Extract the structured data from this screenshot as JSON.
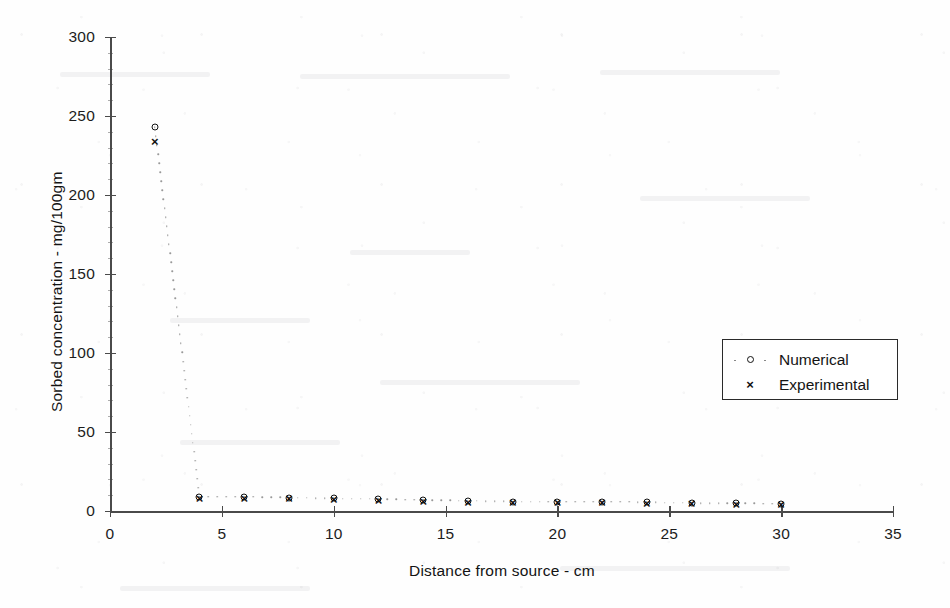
{
  "chart_data": {
    "type": "scatter",
    "title": "",
    "xlabel": "Distance from source  -  cm",
    "ylabel": "Sorbed concentration  -  mg/100gm",
    "xlim": [
      0,
      35
    ],
    "ylim": [
      0,
      300
    ],
    "xticks": [
      0,
      5,
      10,
      15,
      20,
      25,
      30,
      35
    ],
    "yticks": [
      0,
      50,
      100,
      150,
      200,
      250,
      300
    ],
    "xtick_labels": [
      "0",
      "5",
      "10",
      "15",
      "20",
      "25",
      "30",
      "35"
    ],
    "ytick_labels": [
      "0",
      "50",
      "100",
      "150",
      "200",
      "250",
      "300"
    ],
    "grid": false,
    "legend_position": "center-right",
    "x": [
      2,
      4,
      6,
      8,
      10,
      12,
      14,
      16,
      18,
      20,
      22,
      24,
      26,
      28,
      30
    ],
    "series": [
      {
        "name": "Numerical",
        "marker": "circle",
        "values": [
          243,
          9,
          9,
          8.5,
          8,
          7.5,
          7,
          6.5,
          6,
          6,
          6,
          5.5,
          5,
          5,
          4.5
        ]
      },
      {
        "name": "Experimental",
        "marker": "cross",
        "values": [
          234,
          8,
          8.5,
          8,
          7.5,
          7,
          6.5,
          6,
          6,
          5.5,
          6,
          5,
          5,
          4.5,
          4.5
        ]
      }
    ],
    "connector": {
      "style": "dotted",
      "series": "Numerical"
    }
  },
  "legend": {
    "entries": [
      {
        "label": "Numerical",
        "marker_icon": "circle-marker-icon"
      },
      {
        "label": "Experimental",
        "marker_icon": "cross-marker-icon"
      }
    ]
  }
}
